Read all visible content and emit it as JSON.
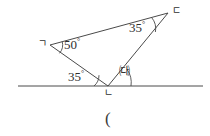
{
  "figure": {
    "type": "geometry-diagram",
    "background_color": "#ffffff",
    "stroke_color": "#4a4a4a",
    "text_color": "#2f2f2f"
  },
  "vertices": [
    {
      "name": "vertex-g",
      "label": "ㄱ",
      "x": 50,
      "y": 45
    },
    {
      "name": "vertex-d",
      "label": "ㄷ",
      "x": 168,
      "y": 13
    },
    {
      "name": "vertex-n",
      "label": "ㄴ",
      "x": 108,
      "y": 86
    }
  ],
  "angles": [
    {
      "name": "angle-at-g",
      "value": "50",
      "degree_symbol": "°",
      "x": 62,
      "y": 38
    },
    {
      "name": "angle-at-d",
      "value": "35",
      "degree_symbol": "°",
      "x": 128,
      "y": 21
    },
    {
      "name": "angle-at-n-left",
      "value": "35",
      "degree_symbol": "°",
      "x": 66,
      "y": 70
    },
    {
      "name": "angle-unknown",
      "value": "㈐",
      "x": 123,
      "y": 69
    }
  ],
  "baseline": {
    "name": "horizontal-line",
    "x1": 18,
    "y1": 86,
    "x2": 203,
    "y2": 86
  },
  "annotations": {
    "trailing_paren": "(",
    "trailing_paren_x": 108,
    "trailing_paren_y": 112
  }
}
